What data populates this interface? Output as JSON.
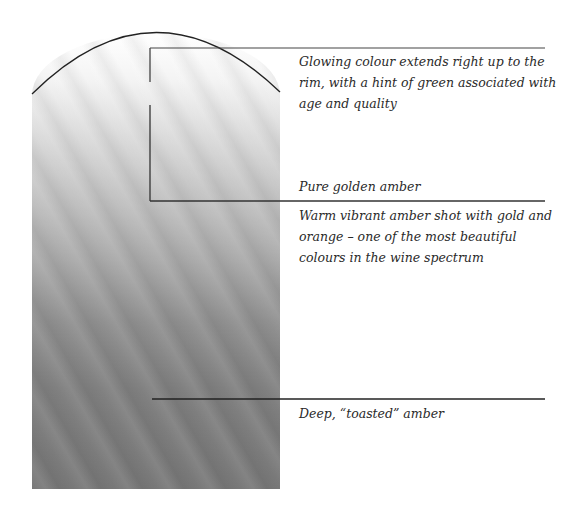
{
  "diagram": {
    "type": "wine-colour-spectrum",
    "shape": "wine glass cross-section (gradient pale to dark)",
    "colors": {
      "top": "#ffffff",
      "middle": "#a9a9a9",
      "bottom": "#787878",
      "lines": "#222222",
      "text": "#2a2a2a"
    },
    "annotations": [
      {
        "id": "rim",
        "text": "Glowing colour extends right up to the rim, with a hint of green associated with age and quality"
      },
      {
        "id": "pure",
        "text": "Pure golden amber"
      },
      {
        "id": "warm",
        "text": "Warm vibrant amber shot with gold and orange – one of the most beautiful colours in the wine spectrum"
      },
      {
        "id": "deep",
        "text": "Deep, “toasted” amber"
      }
    ]
  }
}
